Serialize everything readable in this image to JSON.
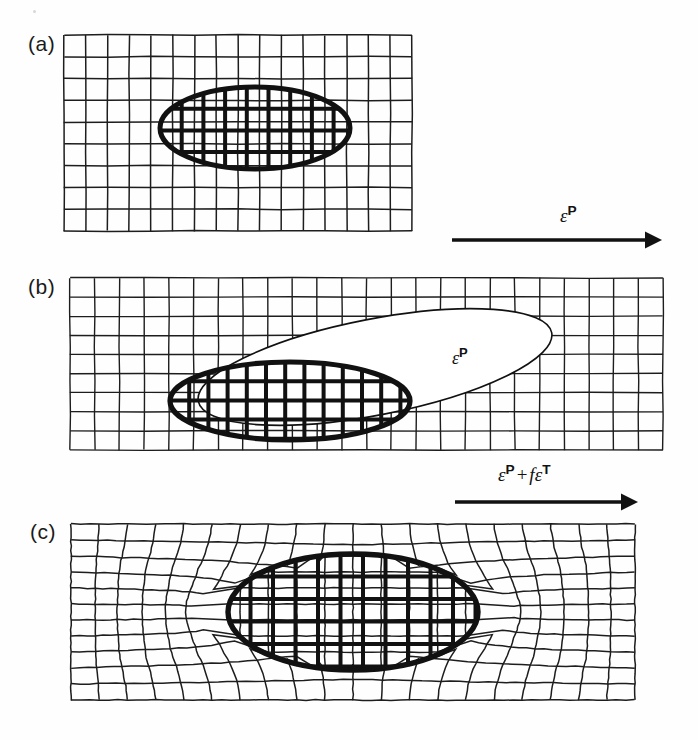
{
  "figure": {
    "type": "scientific-diagram",
    "background_color": "#fefefe",
    "line_color": "#1a1a1a",
    "width": 698,
    "height": 740
  },
  "panels": [
    {
      "id": "a",
      "label": "(a)",
      "description": "Undeformed square grid matrix containing an elliptical inclusion with matching grid",
      "grid": {
        "x": 64,
        "y": 35,
        "width": 348,
        "height": 196,
        "cols": 16,
        "rows": 9,
        "distorted": false
      },
      "inclusion": {
        "cx": 255,
        "cy": 128,
        "rx": 95,
        "ry": 41,
        "rotation": 0,
        "style": "hatched-bold",
        "stroke_width": 5
      }
    },
    {
      "id": "b",
      "label": "(b)",
      "description": "Matrix grid with stress-free transformed inclusion shown as an elongated outlined ellipse overlapping the original hatched inclusion",
      "grid": {
        "x": 70,
        "y": 278,
        "width": 593,
        "height": 172,
        "cols": 24,
        "rows": 9,
        "distorted": false
      },
      "inclusion": {
        "cx": 290,
        "cy": 401,
        "rx": 120,
        "ry": 39,
        "rotation": 0,
        "style": "hatched-bold",
        "stroke_width": 5
      },
      "transformed_shape": {
        "cx": 375,
        "cy": 367,
        "rx": 180,
        "ry": 48,
        "rotation": -11,
        "style": "thin-outline-filled",
        "fill": "#ffffff",
        "stroke_width": 1.6,
        "label": "ε^P"
      }
    },
    {
      "id": "c",
      "label": "(c)",
      "description": "Constrained final state: matrix grid distorted around the elliptical inclusion",
      "grid": {
        "x": 71,
        "y": 524,
        "width": 564,
        "height": 176,
        "cols": 20,
        "rows": 11,
        "distorted": true
      },
      "inclusion": {
        "cx": 353,
        "cy": 612,
        "rx": 125,
        "ry": 58,
        "rotation": 0,
        "style": "hatched-bold",
        "stroke_width": 5
      }
    }
  ],
  "arrows": [
    {
      "id": "arrow-1",
      "label_plain": "ε^P",
      "label_parts": {
        "eps1": "ε",
        "sup1": "P"
      },
      "x1": 452,
      "y1": 240,
      "x2": 662,
      "y2": 240,
      "stroke_width": 3.4
    },
    {
      "id": "arrow-2",
      "label_plain": "ε^P + fε^T",
      "label_parts": {
        "eps1": "ε",
        "sup1": "P",
        "plus": "+",
        "f": "f",
        "eps2": "ε",
        "sup2": "T"
      },
      "x1": 455,
      "y1": 502,
      "x2": 638,
      "y2": 502,
      "stroke_width": 3.4
    }
  ],
  "labels": {
    "panel_a": "(a)",
    "panel_b": "(b)",
    "panel_c": "(c)",
    "inclusion_b_eps": "ε",
    "inclusion_b_sup": "P"
  }
}
